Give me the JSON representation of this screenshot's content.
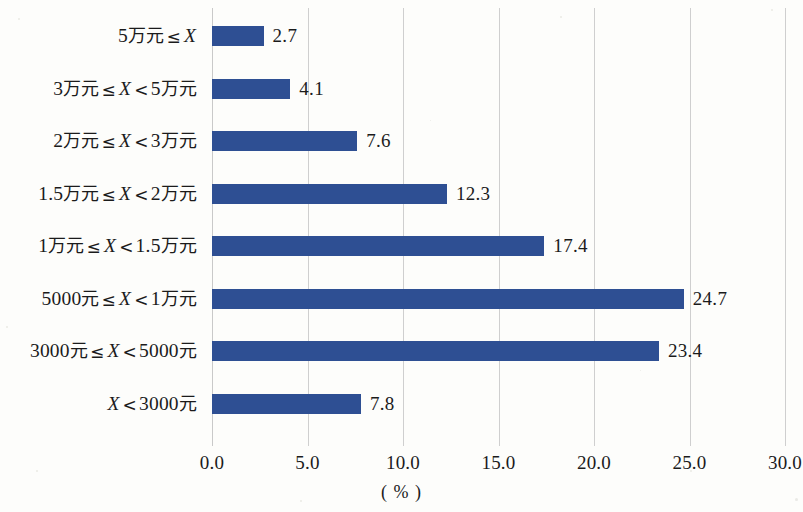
{
  "chart_data": {
    "type": "bar",
    "orientation": "horizontal",
    "title": "",
    "subtitle": "",
    "xlabel": "( % )",
    "ylabel": "",
    "xlim": [
      0.0,
      30.0
    ],
    "xticks": [
      "0.0",
      "5.0",
      "10.0",
      "15.0",
      "20.0",
      "25.0",
      "30.0"
    ],
    "xtick_values": [
      0,
      5,
      10,
      15,
      20,
      25,
      30
    ],
    "grid": "vertical",
    "legend": "none",
    "categories": [
      "5万元 ≤ X",
      "3万元 ≤ X < 5万元",
      "2万元 ≤ X < 3万元",
      "1.5万元 ≤ X < 2万元",
      "1万元 ≤ X < 1.5万元",
      "5000元 ≤ X < 1万元",
      "3000元 ≤ X < 5000元",
      "X < 3000元"
    ],
    "values": [
      2.7,
      4.1,
      7.6,
      12.3,
      17.4,
      24.7,
      23.4,
      7.8
    ],
    "value_labels": [
      "2.7",
      "4.1",
      "7.6",
      "12.3",
      "17.4",
      "24.7",
      "23.4",
      "7.8"
    ],
    "bar_color": "#2e4f93",
    "gridline_color": "#cfcfcf",
    "text_color": "#1b1b1b",
    "background_color": "#fdfdfb"
  },
  "bars": [
    {
      "label": "5万元 ≤ X",
      "parts": [
        {
          "t": "5",
          "k": "num"
        },
        {
          "t": "万元",
          "k": "cn"
        },
        {
          "t": "≤",
          "k": "op"
        },
        {
          "t": "X",
          "k": "var"
        }
      ],
      "value": 2.7,
      "value_label": "2.7"
    },
    {
      "label": "3万元 ≤ X < 5万元",
      "parts": [
        {
          "t": "3",
          "k": "num"
        },
        {
          "t": "万元",
          "k": "cn"
        },
        {
          "t": "≤",
          "k": "op"
        },
        {
          "t": "X",
          "k": "var"
        },
        {
          "t": "<",
          "k": "op"
        },
        {
          "t": "5",
          "k": "num"
        },
        {
          "t": "万元",
          "k": "cn"
        }
      ],
      "value": 4.1,
      "value_label": "4.1"
    },
    {
      "label": "2万元 ≤ X < 3万元",
      "parts": [
        {
          "t": "2",
          "k": "num"
        },
        {
          "t": "万元",
          "k": "cn"
        },
        {
          "t": "≤",
          "k": "op"
        },
        {
          "t": "X",
          "k": "var"
        },
        {
          "t": "<",
          "k": "op"
        },
        {
          "t": "3",
          "k": "num"
        },
        {
          "t": "万元",
          "k": "cn"
        }
      ],
      "value": 7.6,
      "value_label": "7.6"
    },
    {
      "label": "1.5万元 ≤ X < 2万元",
      "parts": [
        {
          "t": "1.5",
          "k": "num"
        },
        {
          "t": "万元",
          "k": "cn"
        },
        {
          "t": "≤",
          "k": "op"
        },
        {
          "t": "X",
          "k": "var"
        },
        {
          "t": "<",
          "k": "op"
        },
        {
          "t": "2",
          "k": "num"
        },
        {
          "t": "万元",
          "k": "cn"
        }
      ],
      "value": 12.3,
      "value_label": "12.3"
    },
    {
      "label": "1万元 ≤ X < 1.5万元",
      "parts": [
        {
          "t": "1",
          "k": "num"
        },
        {
          "t": "万元",
          "k": "cn"
        },
        {
          "t": "≤",
          "k": "op"
        },
        {
          "t": "X",
          "k": "var"
        },
        {
          "t": "<",
          "k": "op"
        },
        {
          "t": "1.5",
          "k": "num"
        },
        {
          "t": "万元",
          "k": "cn"
        }
      ],
      "value": 17.4,
      "value_label": "17.4"
    },
    {
      "label": "5000元 ≤ X < 1万元",
      "parts": [
        {
          "t": "5000",
          "k": "num"
        },
        {
          "t": "元",
          "k": "cn"
        },
        {
          "t": "≤",
          "k": "op"
        },
        {
          "t": "X",
          "k": "var"
        },
        {
          "t": "<",
          "k": "op"
        },
        {
          "t": "1",
          "k": "num"
        },
        {
          "t": "万元",
          "k": "cn"
        }
      ],
      "value": 24.7,
      "value_label": "24.7"
    },
    {
      "label": "3000元 ≤ X < 5000元",
      "parts": [
        {
          "t": "3000",
          "k": "num"
        },
        {
          "t": "元",
          "k": "cn"
        },
        {
          "t": "≤",
          "k": "op"
        },
        {
          "t": "X",
          "k": "var"
        },
        {
          "t": "<",
          "k": "op"
        },
        {
          "t": "5000",
          "k": "num"
        },
        {
          "t": "元",
          "k": "cn"
        }
      ],
      "value": 23.4,
      "value_label": "23.4"
    },
    {
      "label": "X < 3000元",
      "parts": [
        {
          "t": "X",
          "k": "var"
        },
        {
          "t": "<",
          "k": "op"
        },
        {
          "t": "3000",
          "k": "num"
        },
        {
          "t": "元",
          "k": "cn"
        }
      ],
      "value": 7.8,
      "value_label": "7.8"
    }
  ],
  "axis": {
    "ticks": [
      "0.0",
      "5.0",
      "10.0",
      "15.0",
      "20.0",
      "25.0",
      "30.0"
    ],
    "unit_label": "( % )"
  }
}
